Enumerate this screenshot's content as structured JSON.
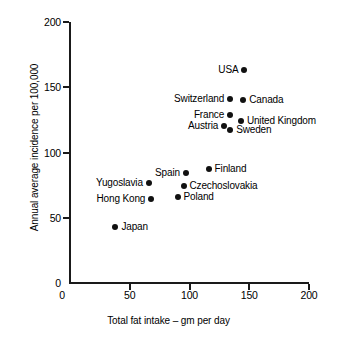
{
  "chart_data": {
    "type": "scatter",
    "title": "",
    "xlabel": "Total fat intake – gm per day",
    "ylabel": "Annual average incidence per 100,000",
    "xlim": [
      0,
      200
    ],
    "ylim": [
      0,
      200
    ],
    "xticks": [
      0,
      50,
      100,
      150,
      200
    ],
    "yticks": [
      0,
      50,
      100,
      150,
      200
    ],
    "xtick_labels": [
      "0",
      "50",
      "100",
      "150",
      "200"
    ],
    "ytick_labels": [
      "0",
      "50",
      "100",
      "150",
      "200"
    ],
    "grid": false,
    "legend": false,
    "marker": "filled-circle",
    "marker_color": "#111111",
    "points": [
      {
        "label": "USA",
        "x": 146,
        "y": 163,
        "label_side": "left"
      },
      {
        "label": "Switzerland",
        "x": 134,
        "y": 141,
        "label_side": "left"
      },
      {
        "label": "Canada",
        "x": 145,
        "y": 140,
        "label_side": "right"
      },
      {
        "label": "France",
        "x": 134,
        "y": 129,
        "label_side": "left"
      },
      {
        "label": "United Kingdom",
        "x": 143,
        "y": 124,
        "label_side": "right"
      },
      {
        "label": "Austria",
        "x": 129,
        "y": 120,
        "label_side": "left"
      },
      {
        "label": "Sweden",
        "x": 134,
        "y": 117,
        "label_side": "right"
      },
      {
        "label": "Finland",
        "x": 116,
        "y": 87,
        "label_side": "right"
      },
      {
        "label": "Spain",
        "x": 97,
        "y": 84,
        "label_side": "left"
      },
      {
        "label": "Yugoslavia",
        "x": 66,
        "y": 77,
        "label_side": "left"
      },
      {
        "label": "Czechoslovakia",
        "x": 95,
        "y": 74,
        "label_side": "right"
      },
      {
        "label": "Poland",
        "x": 90,
        "y": 66,
        "label_side": "right"
      },
      {
        "label": "Hong Kong",
        "x": 68,
        "y": 64,
        "label_side": "left"
      },
      {
        "label": "Japan",
        "x": 38,
        "y": 43,
        "label_side": "right"
      }
    ]
  }
}
